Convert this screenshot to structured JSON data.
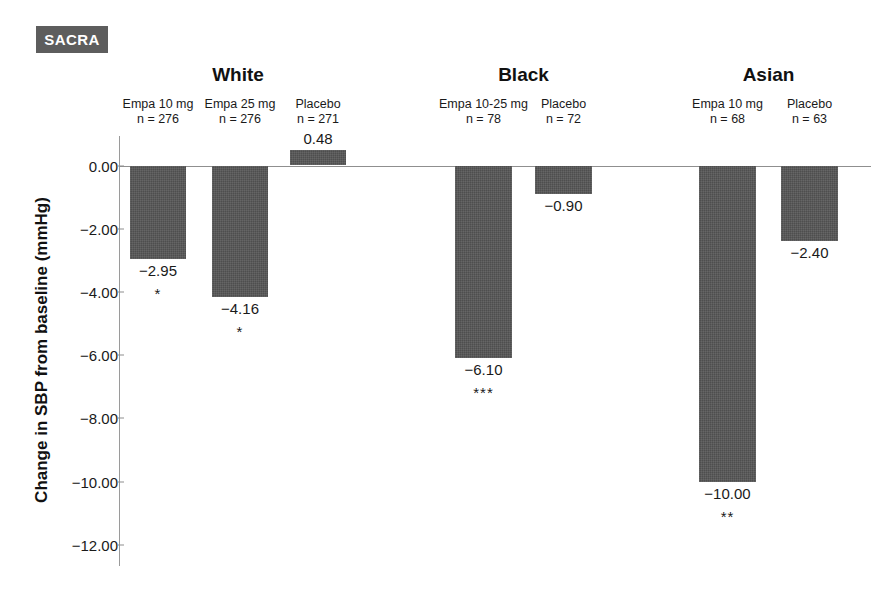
{
  "badge": {
    "label": "SACRA"
  },
  "chart_data": {
    "type": "bar",
    "title": "",
    "xlabel": "",
    "ylabel": "Change in SBP from baseline (mmHg)",
    "ylim": [
      -12.0,
      2.0
    ],
    "yticks": [
      "0.00",
      "-2.00",
      "-4.00",
      "-6.00",
      "-8.00",
      "-10.00",
      "-12.00"
    ],
    "ytick_values": [
      0.0,
      -2.0,
      -4.0,
      -6.0,
      -8.0,
      -10.0,
      -12.0
    ],
    "grid": false,
    "legend": "none",
    "bar_color": "#565656",
    "groups": [
      {
        "name": "White",
        "bars": [
          {
            "arm": "Empa 10 mg",
            "n": "n = 276",
            "value": -2.95,
            "value_label": "−2.95",
            "significance": "*"
          },
          {
            "arm": "Empa 25 mg",
            "n": "n = 276",
            "value": -4.16,
            "value_label": "−4.16",
            "significance": "*"
          },
          {
            "arm": "Placebo",
            "n": "n = 271",
            "value": 0.48,
            "value_label": "0.48",
            "significance": ""
          }
        ]
      },
      {
        "name": "Black",
        "bars": [
          {
            "arm": "Empa 10-25 mg",
            "n": "n = 78",
            "value": -6.1,
            "value_label": "−6.10",
            "significance": "***"
          },
          {
            "arm": "Placebo",
            "n": "n = 72",
            "value": -0.9,
            "value_label": "−0.90",
            "significance": ""
          }
        ]
      },
      {
        "name": "Asian",
        "bars": [
          {
            "arm": "Empa 10 mg",
            "n": "n = 68",
            "value": -10.0,
            "value_label": "−10.00",
            "significance": "**"
          },
          {
            "arm": "Placebo",
            "n": "n = 63",
            "value": -2.4,
            "value_label": "−2.40",
            "significance": ""
          }
        ]
      }
    ]
  }
}
